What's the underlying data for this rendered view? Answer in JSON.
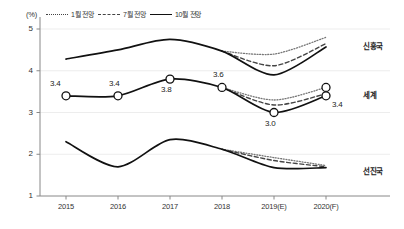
{
  "chart_data": {
    "type": "line",
    "title": "",
    "xlabel": "",
    "ylabel": "",
    "unit": "(%)",
    "categories": [
      "2015",
      "2016",
      "2017",
      "2018",
      "2019(E)",
      "2020(F)"
    ],
    "ylim": [
      1,
      5
    ],
    "yticks": [
      1,
      2,
      3,
      4,
      5
    ],
    "grid": true,
    "legend_position": "top-left",
    "legend": [
      {
        "key": "jan",
        "label": "1월 전망",
        "style": "dotted"
      },
      {
        "key": "jul",
        "label": "7월 전망",
        "style": "dashed"
      },
      {
        "key": "oct",
        "label": "10월 전망",
        "style": "solid"
      }
    ],
    "groups": [
      {
        "key": "emerging",
        "label": "신흥국",
        "label_y": 4.62,
        "series": [
          {
            "name": "1월 전망",
            "style": "dotted",
            "x": [
              "2018",
              "2019(E)",
              "2020(F)"
            ],
            "values": [
              4.47,
              4.4,
              4.8
            ]
          },
          {
            "name": "7월 전망",
            "style": "dashed",
            "x": [
              "2018",
              "2019(E)",
              "2020(F)"
            ],
            "values": [
              4.47,
              4.12,
              4.65
            ]
          },
          {
            "name": "10월 전망",
            "style": "solid",
            "x": [
              "2015",
              "2016",
              "2017",
              "2018",
              "2019(E)",
              "2020(F)"
            ],
            "values": [
              4.28,
              4.5,
              4.75,
              4.47,
              3.9,
              4.57
            ]
          }
        ]
      },
      {
        "key": "world",
        "label": "세계",
        "label_y": 3.45,
        "markers": true,
        "series": [
          {
            "name": "1월 전망",
            "style": "dotted",
            "x": [
              "2018",
              "2019(E)",
              "2020(F)"
            ],
            "values": [
              3.6,
              3.3,
              3.6
            ]
          },
          {
            "name": "7월 전망",
            "style": "dashed",
            "x": [
              "2018",
              "2019(E)",
              "2020(F)"
            ],
            "values": [
              3.6,
              3.18,
              3.45
            ]
          },
          {
            "name": "10월 전망",
            "style": "solid",
            "x": [
              "2015",
              "2016",
              "2017",
              "2018",
              "2019(E)",
              "2020(F)"
            ],
            "values": [
              3.4,
              3.4,
              3.8,
              3.6,
              3.0,
              3.4
            ]
          }
        ],
        "point_labels": [
          {
            "x": "2015",
            "value": "3.4",
            "pos": "above"
          },
          {
            "x": "2016",
            "value": "3.4",
            "pos": "above"
          },
          {
            "x": "2017",
            "value": "3.8",
            "pos": "below"
          },
          {
            "x": "2018",
            "value": "3.6",
            "pos": "above"
          },
          {
            "x": "2019(E)",
            "value": "3.0",
            "pos": "below"
          },
          {
            "x": "2020(F)",
            "value": "3.4",
            "pos": "right-below"
          }
        ]
      },
      {
        "key": "advanced",
        "label": "선진국",
        "label_y": 1.62,
        "series": [
          {
            "name": "1월 전망",
            "style": "dotted",
            "x": [
              "2018",
              "2019(E)",
              "2020(F)"
            ],
            "values": [
              2.12,
              1.92,
              1.73
            ]
          },
          {
            "name": "7월 전망",
            "style": "dashed",
            "x": [
              "2018",
              "2019(E)",
              "2020(F)"
            ],
            "values": [
              2.12,
              1.85,
              1.7
            ]
          },
          {
            "name": "10월 전망",
            "style": "solid",
            "x": [
              "2015",
              "2016",
              "2017",
              "2018",
              "2019(E)",
              "2020(F)"
            ],
            "values": [
              2.3,
              1.7,
              2.35,
              2.12,
              1.68,
              1.68
            ]
          }
        ]
      }
    ],
    "colors": {
      "line_solid": "#111111",
      "line_dashed": "#444444",
      "line_dotted": "#777777",
      "axis": "#888888",
      "grid": "#e8e8e8",
      "text": "#222222",
      "marker_fill": "#ffffff"
    }
  }
}
